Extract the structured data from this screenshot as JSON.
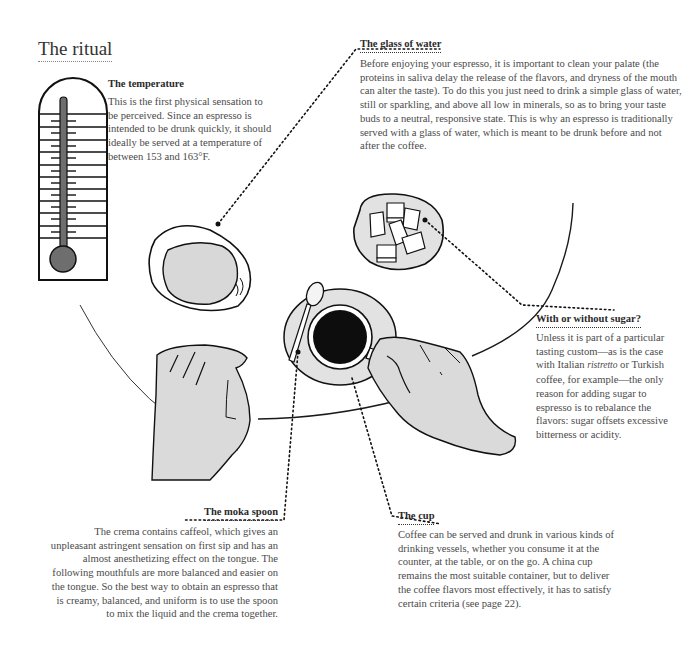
{
  "page": {
    "title": "The ritual"
  },
  "sections": {
    "temperature": {
      "heading": "The temperature",
      "body": "This is the first physical sensation to be perceived. Since an espresso is intended to be drunk quickly, it should ideally be served at a temperature of between 153 and 163°F."
    },
    "water": {
      "heading": "The glass of water",
      "body": "Before enjoying your espresso, it is important to clean your palate (the proteins in saliva delay the release of the flavors, and dryness of the mouth can alter the taste). To do this you just need to drink a simple glass of water, still or sparkling, and above all low in minerals, so as to bring your taste buds to a neutral, responsive state. This is why an espresso is traditionally served with a glass of water, which is meant to be drunk before and not after the coffee."
    },
    "sugar": {
      "heading": "With or without sugar?",
      "body_before": "Unless it is part of a particular tasting custom—as is the case with Italian ",
      "body_italic": "ristretto",
      "body_after": " or Turkish coffee, for example—the only reason for adding sugar to espresso is to rebalance the flavors: sugar offsets excessive bitterness or acidity."
    },
    "spoon": {
      "heading": "The moka spoon",
      "body": "The crema contains caffeol, which gives an unpleasant astringent sensation on first sip and has an almost anesthetizing effect on the tongue. The following mouthfuls are more balanced and easier on the tongue. So the best way to obtain an espresso that is creamy, balanced, and uniform is to use the spoon to mix the liquid and the crema together."
    },
    "cup": {
      "heading": "The cup",
      "body": "Coffee can be served and drunk in various kinds of drinking vessels, whether you consume it at the counter, at the table, or on the go. A china cup remains the most suitable container, but to deliver the coffee flavors most effectively, it has to satisfy certain criteria (see page 22)."
    }
  },
  "illustration": {
    "icons": [
      "thermometer-icon",
      "glass-of-water-icon",
      "sugar-dish-icon",
      "espresso-cup-icon",
      "spoon-icon",
      "left-hand-icon",
      "right-hand-icon",
      "table-edge"
    ],
    "colors": {
      "ink": "#1a1a1a",
      "fill": "#dcdcdc",
      "coffee": "#0d0d0d",
      "thermo_fill": "#6e6e6e"
    }
  }
}
